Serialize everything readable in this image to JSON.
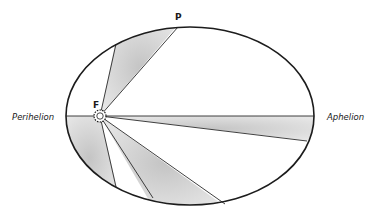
{
  "diagram": {
    "labels": {
      "perihelion": "Perihelion",
      "aphelion": "Aphelion",
      "focus": "F",
      "planet": "P"
    },
    "colors": {
      "outline": "#1c1c1c",
      "sector_fill": "#d4d4d4",
      "background": "#ffffff"
    },
    "ellipse": {
      "cx": 190,
      "cy": 116,
      "rx": 124,
      "ry": 89
    },
    "focus": {
      "x": 100,
      "y": 116
    },
    "sectors": [
      {
        "name": "upper-sector",
        "p1": [
          116,
          44
        ],
        "p2": [
          178,
          27
        ]
      },
      {
        "name": "perihelion-sector",
        "p1": [
          67,
          116
        ],
        "p2": [
          116,
          187
        ]
      },
      {
        "name": "lower-sector",
        "p1": [
          153,
          198
        ],
        "p2": [
          225,
          204
        ]
      },
      {
        "name": "aphelion-sector",
        "p1": [
          314,
          116
        ],
        "p2": [
          307,
          141
        ]
      }
    ]
  }
}
